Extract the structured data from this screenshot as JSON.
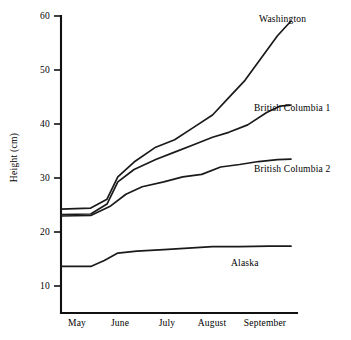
{
  "chart_data": {
    "type": "line",
    "title": "",
    "xlabel": "",
    "ylabel": "Height (cm)",
    "ylim": [
      0,
      60
    ],
    "yticks": [
      10,
      20,
      30,
      40,
      50,
      60
    ],
    "categories": [
      "May",
      "June",
      "July",
      "August",
      "September"
    ],
    "grid": false,
    "legend_position": "right-inline-labels",
    "series": [
      {
        "name": "Washington",
        "label": "Washington",
        "x": [
          0.0,
          0.55,
          0.85,
          1.05,
          1.35,
          1.75,
          2.1,
          2.45,
          2.8,
          3.1,
          3.4,
          3.7,
          4.0,
          4.25
        ],
        "values": [
          21.0,
          21.2,
          23.0,
          27.5,
          30.5,
          33.5,
          35.0,
          37.5,
          40.0,
          43.5,
          47.0,
          51.5,
          56.0,
          59.0
        ]
      },
      {
        "name": "British Columbia 1",
        "label": "British Columbia 1",
        "x": [
          0.0,
          0.55,
          0.85,
          1.05,
          1.35,
          1.75,
          2.1,
          2.45,
          2.8,
          3.1,
          3.45,
          3.8,
          4.05,
          4.25
        ],
        "values": [
          19.9,
          20.0,
          22.0,
          26.5,
          29.0,
          31.0,
          32.5,
          34.0,
          35.5,
          36.5,
          38.0,
          40.5,
          41.8,
          42.0
        ]
      },
      {
        "name": "British Columbia 2",
        "label": "British Columbia 2",
        "x": [
          0.0,
          0.55,
          0.9,
          1.2,
          1.5,
          1.9,
          2.25,
          2.6,
          2.95,
          3.3,
          3.65,
          4.0,
          4.25
        ],
        "values": [
          19.6,
          19.7,
          21.5,
          24.0,
          25.5,
          26.5,
          27.5,
          28.0,
          29.5,
          30.0,
          30.6,
          31.0,
          31.1
        ]
      },
      {
        "name": "Alaska",
        "label": "Alaska",
        "x": [
          0.0,
          0.55,
          0.8,
          1.05,
          1.4,
          1.9,
          2.35,
          2.8,
          3.3,
          3.85,
          4.25
        ],
        "values": [
          9.4,
          9.4,
          10.6,
          12.1,
          12.5,
          12.8,
          13.1,
          13.4,
          13.4,
          13.5,
          13.5
        ]
      }
    ]
  },
  "axis": {
    "y_title": "Height (cm)",
    "y_tick_labels": [
      "60",
      "50",
      "40",
      "30",
      "20",
      "10"
    ],
    "x_tick_labels": [
      "May",
      "June",
      "July",
      "August",
      "September"
    ]
  },
  "series_labels": {
    "washington": "Washington",
    "british_columbia_1": "British Columbia 1",
    "british_columbia_2": "British Columbia 2",
    "alaska": "Alaska"
  },
  "colors": {
    "background": "#ffffff",
    "axis": "#111111",
    "line": "#1a1a1a",
    "text": "#000000"
  }
}
